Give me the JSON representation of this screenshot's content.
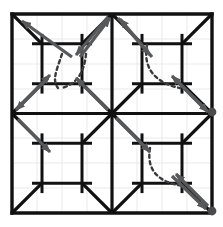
{
  "figure": {
    "type": "diagram",
    "background_color": "#ffffff",
    "canvas": {
      "width": 223,
      "height": 227
    }
  },
  "style": {
    "lattice_color": "#111111",
    "lattice_width": 3.2,
    "border_color": "#111111",
    "border_width": 3.4,
    "tick_color": "#111111",
    "tick_width": 3.0,
    "faint_grid_color": "#e9e9ec",
    "faint_grid_width": 1.0,
    "arrow_color": "#58595b",
    "arrow_width": 3.2,
    "arrow_head_length": 9,
    "arrow_head_width": 7,
    "dashed_color": "#3a3a3c",
    "dashed_width": 2.4,
    "dash_pattern": "3.2 3.4",
    "dot_color": "#4a4a4c",
    "dot_radius": 4.4
  },
  "geometry": {
    "frame": {
      "x0": 12,
      "y0": 14,
      "x1": 212,
      "y1": 213
    },
    "mid_x": 112,
    "mid_y": 113.5,
    "cells": [
      {
        "name": "cell-top-left",
        "x0": 12,
        "y0": 14,
        "x1": 112,
        "y1": 113.5
      },
      {
        "name": "cell-top-right",
        "x0": 112,
        "y0": 14,
        "x1": 212,
        "y1": 113.5
      },
      {
        "name": "cell-bottom-left",
        "x0": 12,
        "y0": 113.5,
        "x1": 112,
        "y1": 213
      },
      {
        "name": "cell-bottom-right",
        "x0": 112,
        "y0": 113.5,
        "x1": 212,
        "y1": 213
      }
    ],
    "hash_inset_ratio": 0.3,
    "hash_overhang_ratio": 0.1,
    "faint_grid_x": [
      37,
      62,
      87,
      137,
      162,
      187
    ],
    "faint_grid_y": [
      39,
      64,
      89,
      138,
      163,
      188
    ]
  },
  "lattice_lines": {
    "description": "Each unit cell carries a hash (#) of two horizontal and two vertical segments, plus four corner diagonals running to the hash intersection points.",
    "outer_border": [
      {
        "name": "border-top",
        "x1": 12,
        "y1": 14,
        "x2": 212,
        "y2": 14
      },
      {
        "name": "border-right",
        "x1": 212,
        "y1": 14,
        "x2": 212,
        "y2": 213
      },
      {
        "name": "border-bottom",
        "x1": 12,
        "y1": 213,
        "x2": 212,
        "y2": 213
      },
      {
        "name": "border-left",
        "x1": 12,
        "y1": 14,
        "x2": 12,
        "y2": 213
      }
    ],
    "interior_axes": [
      {
        "name": "axis-vertical-center",
        "x1": 112,
        "y1": 14,
        "x2": 112,
        "y2": 213
      },
      {
        "name": "axis-horizontal-center",
        "x1": 12,
        "y1": 113.5,
        "x2": 212,
        "y2": 113.5
      }
    ]
  },
  "arrows": [
    {
      "name": "arrow-tl-to-top-left-corner",
      "x1": 72,
      "y1": 57,
      "x2": 22,
      "y2": 21,
      "label": "up-left to NW corner"
    },
    {
      "name": "arrow-top-center-to-tl-hash",
      "x1": 108,
      "y1": 17,
      "x2": 76,
      "y2": 55,
      "label": "down-left from N midpoint"
    },
    {
      "name": "arrow-tl-hash-to-top-center",
      "x1": 80,
      "y1": 57,
      "x2": 110,
      "y2": 18,
      "label": "up-right to N midpoint"
    },
    {
      "name": "arrow-top-center-to-tr-hash",
      "x1": 118,
      "y1": 18,
      "x2": 150,
      "y2": 55,
      "label": "down-right from N midpoint"
    },
    {
      "name": "arrow-tr-hash-to-top-center",
      "x1": 152,
      "y1": 57,
      "x2": 120,
      "y2": 19,
      "label": "up-left to N midpoint"
    },
    {
      "name": "arrow-left-mid-to-tl-hash",
      "x1": 18,
      "y1": 108,
      "x2": 50,
      "y2": 75,
      "label": "up-right from W midpoint"
    },
    {
      "name": "arrow-tl-hash-to-left-mid",
      "x1": 48,
      "y1": 78,
      "x2": 16,
      "y2": 110,
      "label": "down-left to W midpoint"
    },
    {
      "name": "arrow-left-mid-to-bl-hash",
      "x1": 18,
      "y1": 119,
      "x2": 50,
      "y2": 152,
      "label": "down-right from W midpoint"
    },
    {
      "name": "arrow-center-to-tl-hash",
      "x1": 108,
      "y1": 110,
      "x2": 76,
      "y2": 78,
      "label": "up-left to center hash"
    },
    {
      "name": "arrow-center-to-br-hash",
      "x1": 116,
      "y1": 118,
      "x2": 150,
      "y2": 152,
      "label": "down-right from center"
    },
    {
      "name": "arrow-right-mid-to-tr-hash",
      "x1": 206,
      "y1": 110,
      "x2": 172,
      "y2": 76,
      "label": "up-left from E midpoint"
    },
    {
      "name": "arrow-tr-hash-to-right-mid",
      "x1": 174,
      "y1": 78,
      "x2": 208,
      "y2": 112,
      "label": "down-right to E midpoint"
    },
    {
      "name": "arrow-br-hash-to-se-corner",
      "x1": 172,
      "y1": 176,
      "x2": 206,
      "y2": 209,
      "label": "down-right to SE corner"
    },
    {
      "name": "arrow-se-corner-to-br-hash",
      "x1": 208,
      "y1": 206,
      "x2": 176,
      "y2": 174,
      "label": "up-left from SE corner"
    }
  ],
  "dashed_curves": [
    {
      "name": "dashed-curve-top-left-a",
      "d": "M 62 54 C 56 72, 52 80, 58 88",
      "label": "V-shaped left branch"
    },
    {
      "name": "dashed-curve-top-left-b",
      "d": "M 86 54 C 84 74, 76 84, 62 88",
      "label": "V-shaped right branch"
    },
    {
      "name": "dashed-curve-top-right",
      "d": "M 147 45 C 142 72, 160 84, 180 88",
      "label": "arc to hash corner"
    },
    {
      "name": "dashed-curve-bottom-right",
      "d": "M 150 148 C 146 172, 160 182, 182 186",
      "label": "arc to hash corner"
    }
  ],
  "dots": [
    {
      "name": "dot-east-midpoint",
      "cx": 212,
      "cy": 112
    },
    {
      "name": "dot-southeast-corner",
      "cx": 212,
      "cy": 211
    }
  ]
}
